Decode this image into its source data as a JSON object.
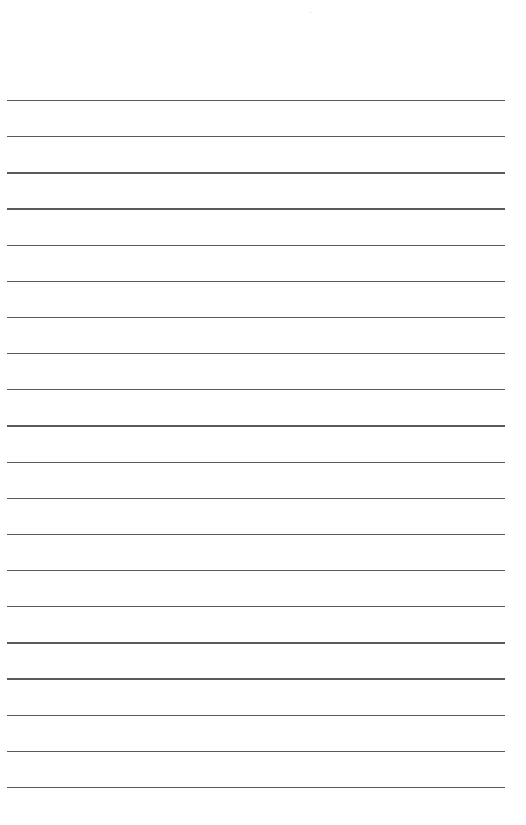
{
  "page": {
    "type": "lined-paper",
    "background_color": "#ffffff",
    "line_color": "#5a5a5a",
    "line_count": 20,
    "first_line_y": 100,
    "line_spacing": 36.15,
    "line_left": 7,
    "line_width": 498
  }
}
